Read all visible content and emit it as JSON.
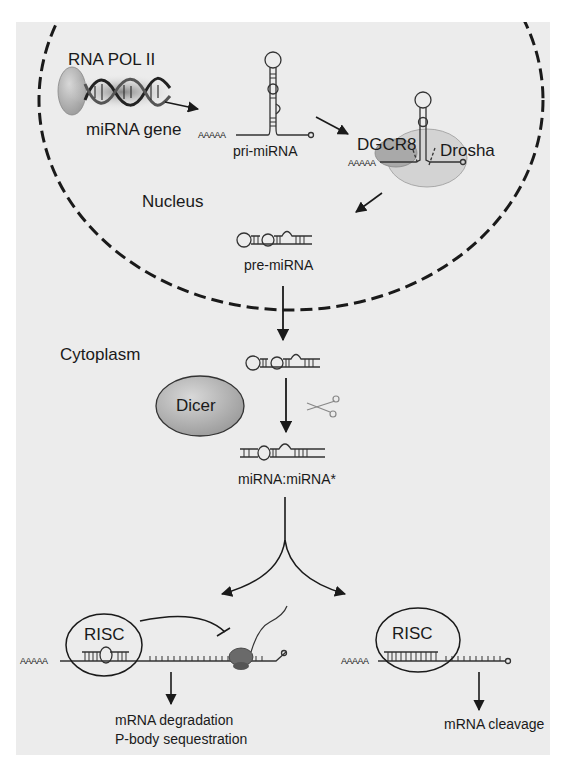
{
  "figure": {
    "compartments": {
      "nucleus": "Nucleus",
      "cytoplasm": "Cytoplasm"
    },
    "nucleus_labels": {
      "polymerase": "RNA POL II",
      "gene": "miRNA gene",
      "pri_polyA": "AAAAA",
      "pri": "pri-miRNA",
      "dgcr8": "DGCR8",
      "drosha": "Drosha",
      "drosha_polyA": "AAAAA",
      "pre": "pre-miRNA"
    },
    "cytoplasm_labels": {
      "dicer": "Dicer",
      "duplex": "miRNA:miRNA*"
    },
    "left_pathway": {
      "complex": "RISC",
      "polyA": "AAAAA",
      "outcome_line1": "mRNA degradation",
      "outcome_line2": "P-body sequestration"
    },
    "right_pathway": {
      "complex": "RISC",
      "polyA": "AAAAA",
      "outcome": "mRNA cleavage"
    },
    "icons": [
      "dna-helix-icon",
      "scissors-icon",
      "ribosome-icon",
      "hairpin-rna-icon"
    ],
    "colors": {
      "panel_bg": "#ececec",
      "page_bg": "#ffffff",
      "line": "#1a1a1a",
      "protein_fill": "#b9b9b9",
      "drosha_fill": "#cfcfcf"
    }
  }
}
